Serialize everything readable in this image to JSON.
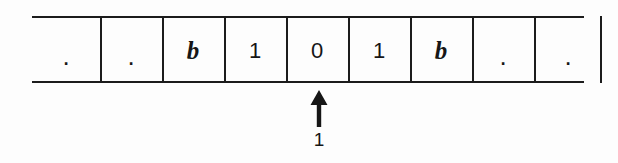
{
  "diagram": {
    "tape": {
      "name": "tape",
      "left_open": true,
      "right_open": true,
      "cells": [
        {
          "index": 0,
          "symbol": ".",
          "kind": "ellipsis",
          "head": false
        },
        {
          "index": 1,
          "symbol": ".",
          "kind": "ellipsis",
          "head": false
        },
        {
          "index": 2,
          "symbol": "b",
          "kind": "blank",
          "head": false
        },
        {
          "index": 3,
          "symbol": "1",
          "kind": "digit",
          "head": false
        },
        {
          "index": 4,
          "symbol": "0",
          "kind": "digit",
          "head": true
        },
        {
          "index": 5,
          "symbol": "1",
          "kind": "digit",
          "head": false
        },
        {
          "index": 6,
          "symbol": "b",
          "kind": "blank",
          "head": false
        },
        {
          "index": 7,
          "symbol": ".",
          "kind": "ellipsis",
          "head": false
        },
        {
          "index": 8,
          "symbol": ".",
          "kind": "ellipsis",
          "head": false
        }
      ]
    },
    "head": {
      "icon": "arrow-up-icon",
      "state_label": "1",
      "points_at_cell_index": 4,
      "points_at_symbol": "0"
    },
    "colors": {
      "ink": "#1c1c1c",
      "text": "#161616",
      "background": "#fdfdfd"
    }
  }
}
